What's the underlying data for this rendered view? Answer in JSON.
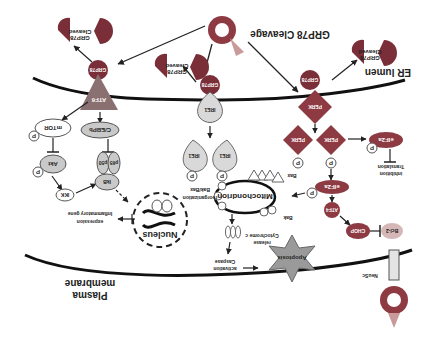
{
  "diagram": {
    "orientation": "rotated 180 degrees",
    "regions": {
      "er_lumen": "ER lumen",
      "plasma_membrane_line1": "Plasma",
      "plasma_membrane_line2": "membrane"
    },
    "title_label": "GRP78 Cleavage",
    "nodes": {
      "grp78": "GRP78",
      "cleaved_grp78_line1": "Cleaved",
      "cleaved_grp78_line2": "GRP78",
      "atf6": "ATF6",
      "ire1": "IRE1",
      "perk": "PERK",
      "eif2a": "eIF2a",
      "atf4": "ATF4",
      "chop": "CHOP",
      "bcl2": "Bcl-2",
      "mtor": "mTOR",
      "akt": "Akt",
      "ikk": "IKK",
      "cebpb": "C/EBPb",
      "p50": "p50",
      "p65": "p65",
      "ikb": "IkB",
      "nucleus": "Nucleus",
      "mitochondrion": "Mitochondrion",
      "apoptosis": "Apoptosis",
      "bax": "Bax",
      "bak": "Bak",
      "neusc": "NeuSc",
      "phospho": "P"
    },
    "annotations": {
      "translation_inhibition_line1": "Translation",
      "translation_inhibition_line2": "inhibition",
      "bak_bax_line1": "Bak/Bax",
      "bak_bax_line2": "reorganization",
      "inflammatory_line1": "Inflammatory gene",
      "inflammatory_line2": "expression",
      "cytochrome_line1": "Cytochrome c",
      "cytochrome_line2": "release",
      "caspase_line1": "Caspase",
      "caspase_line2": "activation"
    },
    "colors": {
      "dark_red": "#8e3a43",
      "grp78_red": "#7a2e38",
      "light_red": "#c99a9a",
      "gray_mid": "#9a9a9a",
      "gray_light": "#d6d6d6",
      "gray_dark": "#555555",
      "membrane": "#111111"
    }
  }
}
